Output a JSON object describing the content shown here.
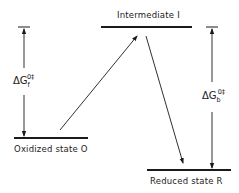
{
  "diagram": {
    "type": "energy-level-diagram",
    "levels": [
      {
        "id": "intermediate",
        "label": "Intermediate I"
      },
      {
        "id": "oxidized",
        "label": "Oxidized state O"
      },
      {
        "id": "reduced",
        "label": "Reduced state R"
      }
    ],
    "transitions": [
      {
        "from": "oxidized",
        "to": "intermediate"
      },
      {
        "from": "intermediate",
        "to": "reduced"
      }
    ],
    "barriers": [
      {
        "id": "forward",
        "symbol": "ΔG",
        "subscript": "f",
        "superscript": "0‡"
      },
      {
        "id": "backward",
        "symbol": "ΔG",
        "subscript": "b",
        "superscript": "0‡"
      }
    ],
    "colors": {
      "line": "#1a1a1a",
      "text": "#222222",
      "background": "#ffffff"
    }
  }
}
